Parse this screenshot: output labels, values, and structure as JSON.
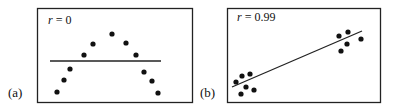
{
  "chart_data": [
    {
      "type": "scatter",
      "panel_label": "(a)",
      "annotation": "r = 0",
      "r_symbol": "r",
      "r_value": "= 0",
      "points": [
        [
          57,
          92
        ],
        [
          64,
          80
        ],
        [
          70,
          69
        ],
        [
          84,
          55
        ],
        [
          93,
          44
        ],
        [
          112,
          34
        ],
        [
          126,
          43
        ],
        [
          136,
          55
        ],
        [
          144,
          72
        ],
        [
          152,
          81
        ],
        [
          158,
          93
        ]
      ],
      "fit_line": [
        [
          50,
          61
        ],
        [
          161,
          61
        ]
      ],
      "description": "Inverted U-shaped (parabolic) pattern with horizontal regression line; correlation coefficient 0",
      "grid": false
    },
    {
      "type": "scatter",
      "panel_label": "(b)",
      "annotation": "r = 0.99",
      "r_symbol": "r",
      "r_value": "= 0.99",
      "points": [
        [
          236,
          82
        ],
        [
          242,
          76
        ],
        [
          250,
          74
        ],
        [
          246,
          87
        ],
        [
          241,
          94
        ],
        [
          254,
          90
        ],
        [
          339,
          36
        ],
        [
          348,
          32
        ],
        [
          361,
          39
        ],
        [
          347,
          44
        ],
        [
          341,
          51
        ]
      ],
      "fit_line": [
        [
          232,
          87
        ],
        [
          362,
          31
        ]
      ],
      "description": "Two clusters (lower-left and upper-right) with strongly positive sloped regression line; correlation coefficient 0.99",
      "grid": false
    }
  ]
}
